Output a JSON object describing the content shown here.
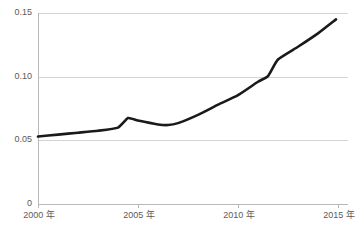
{
  "chart_data": {
    "type": "line",
    "title": "",
    "subtitle": "",
    "xlabel": "",
    "ylabel": "",
    "xlim": [
      2000,
      2015.5
    ],
    "ylim": [
      0,
      0.15
    ],
    "grid": true,
    "legend": false,
    "legend_position": "none",
    "line_color": "#1a1a1a",
    "grid_color": "#d4d4d4",
    "axis_color": "#b8b8b8",
    "label_color": "#5a5a5a",
    "y_ticks": [
      {
        "value": 0.15,
        "label": "0.15"
      },
      {
        "value": 0.1,
        "label": "0.10"
      },
      {
        "value": 0.05,
        "label": "0.05"
      },
      {
        "value": 0,
        "label": "0"
      }
    ],
    "x_ticks": [
      {
        "value": 2000,
        "label": "2000 年"
      },
      {
        "value": 2005,
        "label": "2005 年"
      },
      {
        "value": 2010,
        "label": "2010 年"
      },
      {
        "value": 2015,
        "label": "2015 年"
      }
    ],
    "series": [
      {
        "name": "series-1",
        "color": "#1a1a1a",
        "x": [
          2000,
          2001,
          2002,
          2003,
          2004,
          2004.5,
          2005,
          2006,
          2006.5,
          2007,
          2008,
          2009,
          2010,
          2011,
          2011.5,
          2012,
          2013,
          2014,
          2014.9
        ],
        "values": [
          0.053,
          0.0545,
          0.056,
          0.0575,
          0.06,
          0.0675,
          0.0655,
          0.0625,
          0.062,
          0.0635,
          0.07,
          0.078,
          0.0855,
          0.096,
          0.1005,
          0.1135,
          0.1235,
          0.134,
          0.145
        ]
      }
    ]
  }
}
